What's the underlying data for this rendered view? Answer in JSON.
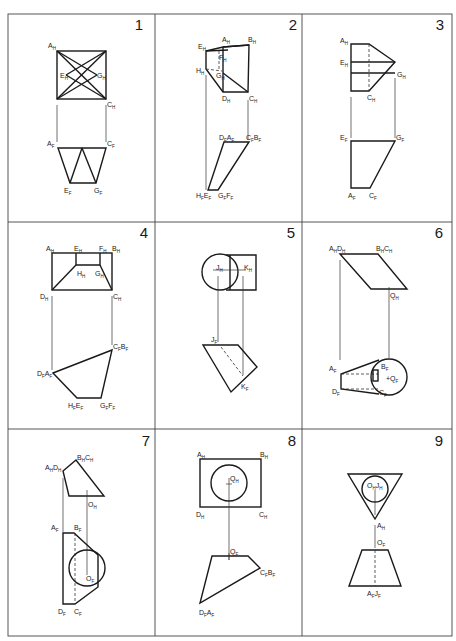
{
  "sheet": {
    "title": "Orthographic projection exercises",
    "panels": [
      {
        "number": "1",
        "labels": [
          {
            "id": "AH",
            "main": "A",
            "sub": "H"
          },
          {
            "id": "EH",
            "main": "E",
            "sub": "H"
          },
          {
            "id": "GH",
            "main": "G",
            "sub": "H"
          },
          {
            "id": "CH",
            "main": "C",
            "sub": "H"
          },
          {
            "id": "AF",
            "main": "A",
            "sub": "F"
          },
          {
            "id": "CF",
            "main": "C",
            "sub": "F"
          },
          {
            "id": "EF",
            "main": "E",
            "sub": "F"
          },
          {
            "id": "GF",
            "main": "G",
            "sub": "F"
          }
        ]
      },
      {
        "number": "2",
        "labels": [
          {
            "id": "EH",
            "main": "E",
            "sub": "H"
          },
          {
            "id": "AH",
            "main": "A",
            "sub": "H"
          },
          {
            "id": "BH",
            "main": "B",
            "sub": "H"
          },
          {
            "id": "FH",
            "main": "F",
            "sub": "H"
          },
          {
            "id": "HH",
            "main": "H",
            "sub": "H"
          },
          {
            "id": "GH",
            "main": "G",
            "sub": "H"
          },
          {
            "id": "DH",
            "main": "D",
            "sub": "H"
          },
          {
            "id": "CH",
            "main": "C",
            "sub": "H"
          },
          {
            "id": "DFAF",
            "main": "D",
            "sub": "F",
            "main2": "A",
            "sub2": "F"
          },
          {
            "id": "CFBF",
            "main": "C",
            "sub": "F",
            "main2": "B",
            "sub2": "F"
          },
          {
            "id": "HFEF",
            "main": "H",
            "sub": "F",
            "main2": "E",
            "sub2": "F"
          },
          {
            "id": "GFFF",
            "main": "G",
            "sub": "F",
            "main2": "F",
            "sub2": "F"
          }
        ]
      },
      {
        "number": "3",
        "labels": [
          {
            "id": "AH",
            "main": "A",
            "sub": "H"
          },
          {
            "id": "EH",
            "main": "E",
            "sub": "H"
          },
          {
            "id": "GH",
            "main": "G",
            "sub": "H"
          },
          {
            "id": "CH",
            "main": "C",
            "sub": "H"
          },
          {
            "id": "EF",
            "main": "E",
            "sub": "F"
          },
          {
            "id": "GF",
            "main": "G",
            "sub": "F"
          },
          {
            "id": "AF",
            "main": "A",
            "sub": "F"
          },
          {
            "id": "CF",
            "main": "C",
            "sub": "F"
          }
        ]
      },
      {
        "number": "4",
        "labels": [
          {
            "id": "AH",
            "main": "A",
            "sub": "H"
          },
          {
            "id": "EH",
            "main": "E",
            "sub": "H"
          },
          {
            "id": "FH",
            "main": "F",
            "sub": "H"
          },
          {
            "id": "BH",
            "main": "B",
            "sub": "H"
          },
          {
            "id": "HH",
            "main": "H",
            "sub": "H"
          },
          {
            "id": "GH",
            "main": "G",
            "sub": "H"
          },
          {
            "id": "DH",
            "main": "D",
            "sub": "H"
          },
          {
            "id": "CH",
            "main": "C",
            "sub": "H"
          },
          {
            "id": "CFBF",
            "main": "C",
            "sub": "F",
            "main2": "B",
            "sub2": "F"
          },
          {
            "id": "DFAF",
            "main": "D",
            "sub": "F",
            "main2": "A",
            "sub2": "F"
          },
          {
            "id": "HFEF",
            "main": "H",
            "sub": "F",
            "main2": "E",
            "sub2": "F"
          },
          {
            "id": "GFFF",
            "main": "G",
            "sub": "F",
            "main2": "F",
            "sub2": "F"
          }
        ]
      },
      {
        "number": "5",
        "labels": [
          {
            "id": "JH",
            "main": "J",
            "sub": "H"
          },
          {
            "id": "KH",
            "main": "K",
            "sub": "H"
          },
          {
            "id": "JF",
            "main": "J",
            "sub": "F"
          },
          {
            "id": "KF",
            "main": "K",
            "sub": "F"
          }
        ]
      },
      {
        "number": "6",
        "labels": [
          {
            "id": "AHDH",
            "main": "A",
            "sub": "H",
            "main2": "D",
            "sub2": "H"
          },
          {
            "id": "BHCH",
            "main": "B",
            "sub": "H",
            "main2": "C",
            "sub2": "H"
          },
          {
            "id": "QH",
            "main": "Q",
            "sub": "H"
          },
          {
            "id": "AF",
            "main": "A",
            "sub": "F"
          },
          {
            "id": "BF",
            "main": "B",
            "sub": "F"
          },
          {
            "id": "QF",
            "main": "+Q",
            "sub": "F"
          },
          {
            "id": "DF",
            "main": "D",
            "sub": "F"
          },
          {
            "id": "CF",
            "main": "C",
            "sub": "F"
          }
        ]
      },
      {
        "number": "7",
        "labels": [
          {
            "id": "BHCH",
            "main": "B",
            "sub": "H",
            "main2": "C",
            "sub2": "H"
          },
          {
            "id": "AHDH",
            "main": "A",
            "sub": "H",
            "main2": "D",
            "sub2": "H"
          },
          {
            "id": "OH",
            "main": "O",
            "sub": "H"
          },
          {
            "id": "AF",
            "main": "A",
            "sub": "F"
          },
          {
            "id": "BF",
            "main": "B",
            "sub": "F"
          },
          {
            "id": "OF",
            "main": "O",
            "sub": "F"
          },
          {
            "id": "DF",
            "main": "D",
            "sub": "F"
          },
          {
            "id": "CF",
            "main": "C",
            "sub": "F"
          }
        ]
      },
      {
        "number": "8",
        "labels": [
          {
            "id": "AH",
            "main": "A",
            "sub": "H"
          },
          {
            "id": "BH",
            "main": "B",
            "sub": "H"
          },
          {
            "id": "QH",
            "main": "Q",
            "sub": "H"
          },
          {
            "id": "DH",
            "main": "D",
            "sub": "H"
          },
          {
            "id": "CH",
            "main": "C",
            "sub": "H"
          },
          {
            "id": "QF",
            "main": "Q",
            "sub": "F"
          },
          {
            "id": "CFBF",
            "main": "C",
            "sub": "F",
            "main2": "B",
            "sub2": "F"
          },
          {
            "id": "DFAF",
            "main": "D",
            "sub": "F",
            "main2": "A",
            "sub2": "F"
          }
        ]
      },
      {
        "number": "9",
        "labels": [
          {
            "id": "OHJH",
            "main": "O",
            "sub": "H",
            "main2": "J",
            "sub2": "H"
          },
          {
            "id": "AH",
            "main": "A",
            "sub": "H"
          },
          {
            "id": "OF",
            "main": "O",
            "sub": "F"
          },
          {
            "id": "AFJF",
            "main": "A",
            "sub": "F",
            "main2": "J",
            "sub2": "F"
          }
        ]
      }
    ]
  }
}
